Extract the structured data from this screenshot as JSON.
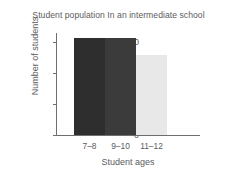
{
  "chart_data": {
    "type": "bar",
    "title": "Student population In an intermediate school",
    "xlabel": "Student ages",
    "ylabel": "Number of students",
    "categories": [
      "7–8",
      "9–10",
      "11–12"
    ],
    "values": [
      63,
      63,
      52
    ],
    "ylim": [
      0,
      66
    ],
    "yticks": [
      0,
      20,
      40,
      60
    ],
    "ytick_labels": [
      "0",
      "20",
      "40",
      "60"
    ],
    "grid": false,
    "legend": false,
    "bar_colors": [
      "#2e2e2e",
      "#3b3b3b",
      "#e8e8e8"
    ],
    "bars_contiguous": true
  },
  "style": {
    "axis_color": "#6e6e70",
    "text_color": "#5c5c5e",
    "background": "#ffffff"
  }
}
